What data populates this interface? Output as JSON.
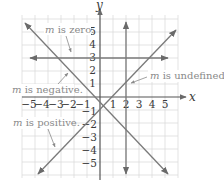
{
  "figure": {
    "axes": {
      "x_label": "x",
      "y_label": "y",
      "x_ticks_negative": [
        "−5",
        "−4",
        "−3",
        "−2",
        "−1"
      ],
      "x_ticks_positive": [
        "1",
        "2",
        "3",
        "4",
        "5"
      ],
      "y_ticks_positive": [
        "5",
        "4",
        "3",
        "2",
        "1"
      ],
      "y_ticks_negative": [
        "−1",
        "−2",
        "−3",
        "−4",
        "−5"
      ]
    },
    "annotations": {
      "zero": {
        "m": "m",
        "text": " is zero."
      },
      "negative": {
        "m": "m",
        "text": " is negative."
      },
      "undefined": {
        "m": "m",
        "text": " is undefined."
      },
      "positive": {
        "m": "m",
        "text": " is positive."
      }
    },
    "lines": [
      {
        "name": "horizontal",
        "equation": "y = 3",
        "slope": "zero"
      },
      {
        "name": "vertical",
        "equation": "x = 2",
        "slope": "undefined"
      },
      {
        "name": "negative-slope",
        "equation": "y = -x",
        "slope": "negative"
      },
      {
        "name": "positive-slope",
        "equation": "y = x - 2",
        "slope": "positive"
      }
    ],
    "colors": {
      "grid": "#dcdcdc",
      "axis": "#555555",
      "line": "#7a7a7a",
      "text": "#3a3a3a",
      "note": "#8a8a8a"
    }
  }
}
